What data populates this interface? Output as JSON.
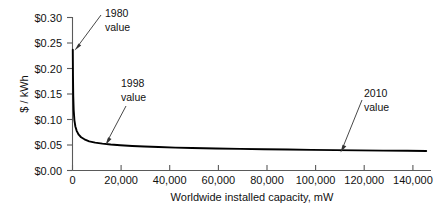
{
  "chart_data": {
    "type": "line",
    "title": "",
    "xlabel": "Worldwide installed capacity, mW",
    "ylabel": "$ / kWh",
    "xlim": [
      0,
      150000
    ],
    "ylim": [
      0.0,
      0.3
    ],
    "grid": false,
    "legend": null,
    "x_ticks": [
      0,
      20000,
      40000,
      60000,
      80000,
      100000,
      120000,
      140000
    ],
    "x_tick_labels": [
      "0",
      "20,000",
      "40,000",
      "60,000",
      "80,000",
      "100,000",
      "120,000",
      "140,000"
    ],
    "y_ticks": [
      0.0,
      0.05,
      0.1,
      0.15,
      0.2,
      0.25,
      0.3
    ],
    "y_tick_labels": [
      "$0.00",
      "$0.05",
      "$0.10",
      "$0.15",
      "$0.20",
      "$0.25",
      "$0.30"
    ],
    "series": [
      {
        "name": "Solar PV cost experience curve",
        "x": [
          120,
          200,
          320,
          500,
          800,
          1200,
          1800,
          2600,
          3600,
          5000,
          7000,
          9500,
          12500,
          16000,
          20000,
          25000,
          30000,
          36000,
          43000,
          50000,
          60000,
          70000,
          80000,
          90000,
          100000,
          110000,
          120000,
          130000,
          140000,
          148000
        ],
        "y": [
          0.236,
          0.185,
          0.145,
          0.118,
          0.098,
          0.086,
          0.077,
          0.07,
          0.065,
          0.061,
          0.057,
          0.0545,
          0.0525,
          0.0508,
          0.0494,
          0.048,
          0.0469,
          0.0458,
          0.0448,
          0.044,
          0.043,
          0.0422,
          0.0415,
          0.0409,
          0.0403,
          0.0398,
          0.0393,
          0.0389,
          0.0385,
          0.0382
        ]
      }
    ],
    "annotations": [
      {
        "id": "1980",
        "line1": "1980",
        "line2": "value",
        "point_x": 300,
        "point_y": 0.233
      },
      {
        "id": "1998",
        "line1": "1998",
        "line2": "value",
        "point_x": 16500,
        "point_y": 0.0505
      },
      {
        "id": "2010",
        "line1": "2010",
        "line2": "value",
        "point_x": 109000,
        "point_y": 0.04
      }
    ]
  },
  "axes": {
    "y_axis_title": "$ / kWh",
    "x_axis_title": "Worldwide installed capacity, mW"
  },
  "labels": {
    "y": [
      "$0.30",
      "$0.25",
      "$0.20",
      "$0.15",
      "$0.10",
      "$0.05",
      "$0.00"
    ],
    "x": [
      "0",
      "20,000",
      "40,000",
      "60,000",
      "80,000",
      "100,000",
      "120,000",
      "140,000"
    ]
  },
  "annotation_text": {
    "a1980_l1": "1980",
    "a1980_l2": "value",
    "a1998_l1": "1998",
    "a1998_l2": "value",
    "a2010_l1": "2010",
    "a2010_l2": "value"
  },
  "colors": {
    "curve": "#000000",
    "axis": "#5a5a5a",
    "text": "#111111",
    "arrow": "#333333",
    "background": "#ffffff"
  }
}
